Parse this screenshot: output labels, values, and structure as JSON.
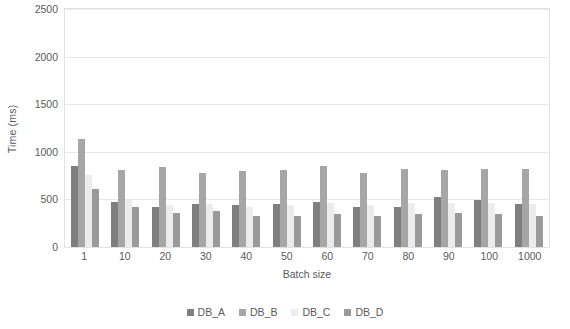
{
  "chart_data": {
    "type": "bar",
    "title": "",
    "xlabel": "Batch size",
    "ylabel": "Time (ms)",
    "categories": [
      "1",
      "10",
      "20",
      "30",
      "40",
      "50",
      "60",
      "70",
      "80",
      "90",
      "100",
      "1000"
    ],
    "series": [
      {
        "name": "DB_A",
        "color": "#7f7f7f",
        "values": [
          850,
          470,
          420,
          450,
          440,
          450,
          470,
          420,
          420,
          530,
          490,
          450
        ]
      },
      {
        "name": "DB_B",
        "color": "#a6a6a6",
        "values": [
          1130,
          810,
          840,
          780,
          800,
          810,
          850,
          780,
          815,
          810,
          820,
          815
        ]
      },
      {
        "name": "DB_C",
        "color": "#ececec",
        "values": [
          760,
          490,
          440,
          450,
          420,
          440,
          460,
          440,
          460,
          460,
          460,
          450
        ]
      },
      {
        "name": "DB_D",
        "color": "#9a9a9a",
        "values": [
          610,
          420,
          360,
          380,
          330,
          330,
          350,
          330,
          350,
          360,
          350,
          325
        ]
      }
    ],
    "ylim": [
      0,
      2500
    ],
    "yticks": [
      0,
      500,
      1000,
      1500,
      2000,
      2500
    ],
    "grid": true,
    "legend_position": "bottom"
  }
}
